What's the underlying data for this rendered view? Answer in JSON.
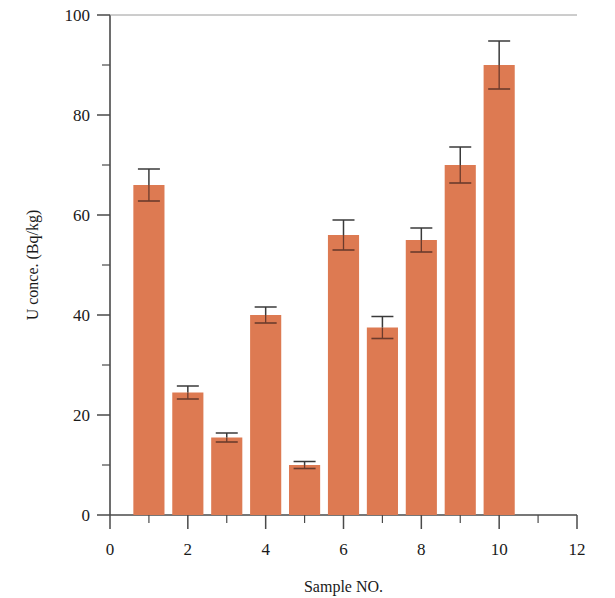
{
  "chart_data": {
    "type": "bar",
    "title": "",
    "subtitle": "",
    "xlabel": "Sample NO.",
    "ylabel": "U conce. (Bq/kg)",
    "xlim": [
      0,
      12
    ],
    "ylim": [
      0,
      100
    ],
    "grid": false,
    "legend": null,
    "bar_color": "#dd7a52",
    "error_bar_color": "#3a3a3a",
    "axis_color": "#4a4a4a",
    "x_major_ticks": [
      0,
      2,
      4,
      6,
      8,
      10,
      12
    ],
    "x_minor_ticks": [
      1,
      3,
      5,
      7,
      9,
      11
    ],
    "x_tick_labels": [
      "0",
      "2",
      "4",
      "6",
      "8",
      "10",
      "12"
    ],
    "y_major_ticks": [
      0,
      20,
      40,
      60,
      80,
      100
    ],
    "y_minor_ticks": [
      10,
      30,
      50,
      70,
      90
    ],
    "y_tick_labels": [
      "0",
      "20",
      "40",
      "60",
      "80",
      "100"
    ],
    "categories": [
      "1",
      "2",
      "3",
      "4",
      "5",
      "6",
      "7",
      "8",
      "9",
      "10"
    ],
    "x": [
      1,
      2,
      3,
      4,
      5,
      6,
      7,
      8,
      9,
      10
    ],
    "values": [
      66,
      24.5,
      15.5,
      40,
      10,
      56,
      37.5,
      55,
      70,
      90
    ],
    "errors": [
      3.2,
      1.3,
      0.9,
      1.6,
      0.7,
      3.0,
      2.2,
      2.4,
      3.6,
      4.8
    ],
    "bar_width": 0.8
  }
}
